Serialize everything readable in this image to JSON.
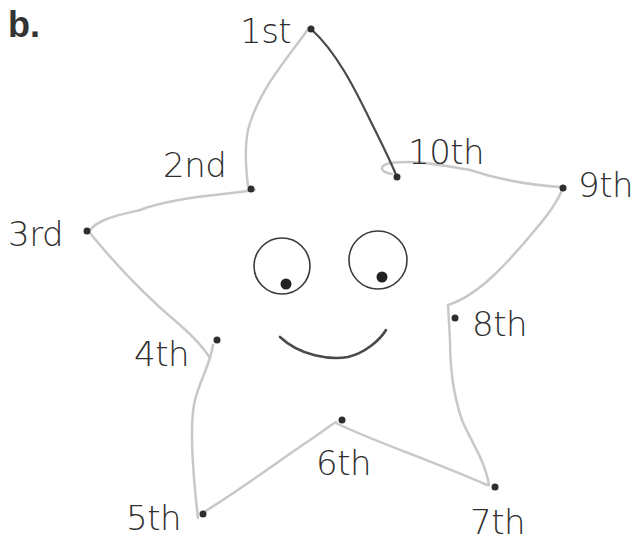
{
  "part_label": "b.",
  "colors": {
    "dot": "#2e2e2e",
    "pencil_trace": "#c8c8c8",
    "dark_trace": "#4a4a4a",
    "text": "#2f2f2f",
    "face_line": "#4a4a4a"
  },
  "points": [
    {
      "label": "1st"
    },
    {
      "label": "2nd"
    },
    {
      "label": "3rd"
    },
    {
      "label": "4th"
    },
    {
      "label": "5th"
    },
    {
      "label": "6th"
    },
    {
      "label": "7th"
    },
    {
      "label": "8th"
    },
    {
      "label": "9th"
    },
    {
      "label": "10th"
    }
  ],
  "face": {
    "eyes": [
      "left-eye",
      "right-eye"
    ],
    "mouth": "smile"
  }
}
